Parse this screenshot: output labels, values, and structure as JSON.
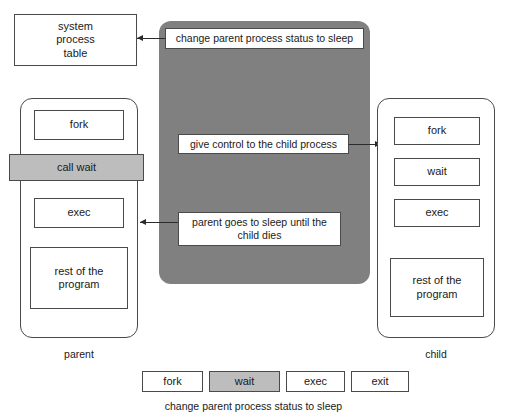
{
  "figure": {
    "clipped_top_text": "",
    "panel_color": "#808080",
    "highlight_color": "#bdbdbd",
    "box_border_color": "#4a4a4a"
  },
  "system_table": {
    "label": "system\nprocess\ntable",
    "line1": "system",
    "line2": "process",
    "line3": "table"
  },
  "grey_panel": {
    "steps": [
      {
        "id": "step-change-status",
        "label": "change parent process status to sleep"
      },
      {
        "id": "step-give-control",
        "label": "give control to the child process"
      },
      {
        "id": "step-parent-sleep",
        "line1": "parent goes to sleep until the",
        "line2": "child dies"
      }
    ]
  },
  "parent_lane": {
    "caption": "parent",
    "items": [
      {
        "id": "parent-fork",
        "label": "fork",
        "highlight": false
      },
      {
        "id": "parent-call-wait",
        "label": "call wait",
        "highlight": true
      },
      {
        "id": "parent-exec",
        "label": "exec",
        "highlight": false
      },
      {
        "id": "parent-rest",
        "line1": "rest of the",
        "line2": "program",
        "highlight": false
      }
    ]
  },
  "child_lane": {
    "caption": "child",
    "items": [
      {
        "id": "child-fork",
        "label": "fork",
        "highlight": false
      },
      {
        "id": "child-wait",
        "label": "wait",
        "highlight": false
      },
      {
        "id": "child-exec",
        "label": "exec",
        "highlight": false
      },
      {
        "id": "child-rest",
        "line1": "rest of the",
        "line2": "program",
        "highlight": false
      }
    ]
  },
  "bottom_strip": {
    "items": [
      {
        "id": "strip-fork",
        "label": "fork",
        "highlight": false
      },
      {
        "id": "strip-wait",
        "label": "wait",
        "highlight": true
      },
      {
        "id": "strip-exec",
        "label": "exec",
        "highlight": false
      },
      {
        "id": "strip-exit",
        "label": "exit",
        "highlight": false
      }
    ],
    "caption": "change parent process status to sleep"
  }
}
